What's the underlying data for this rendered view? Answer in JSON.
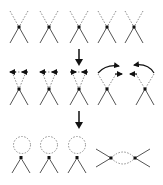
{
  "diagram": {
    "title": "",
    "colors": {
      "line": "#555555",
      "dashed": "#8a8a8a",
      "vertex": "#111111",
      "arrow": "#111111",
      "background": "#ffffff"
    },
    "rows": [
      {
        "name": "four-point-vertices",
        "count": 5,
        "description": "Five X-shaped vertices, upper legs dashed, lower legs solid"
      },
      {
        "name": "contraction-step",
        "count": 5,
        "description": "Vertices with arrows indicating leg contractions: three self-contractions, one pair contracted with each other"
      },
      {
        "name": "result-diagrams",
        "count": 4,
        "description": "Three tadpole loop diagrams and one bubble diagram"
      }
    ],
    "transitions": [
      {
        "name": "step-arrow-1",
        "direction": "down"
      },
      {
        "name": "step-arrow-2",
        "direction": "down"
      }
    ]
  }
}
